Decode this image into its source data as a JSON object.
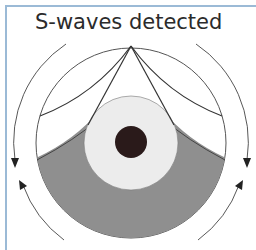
{
  "diagram": {
    "title": "S-waves detected",
    "type": "earth-cross-section",
    "elements": {
      "mantle": {
        "label": "mantle",
        "fill": "#ffffff",
        "stroke": "#555555"
      },
      "outer_core": {
        "label": "outer core",
        "fill": "#ececec"
      },
      "inner_core": {
        "label": "inner core",
        "fill": "#2a1a1a"
      },
      "shadow_zone": {
        "label": "S-wave shadow zone",
        "fill": "#8f8f8f"
      },
      "wave_source": {
        "label": "earthquake focus"
      },
      "ray_paths": 4,
      "direction_arrows": 4
    },
    "colors": {
      "frame_border": "#9bbad6",
      "line": "#444444",
      "shadow": "#8f8f8f",
      "core_light": "#ececec",
      "core_dark": "#2a1a1a"
    }
  }
}
